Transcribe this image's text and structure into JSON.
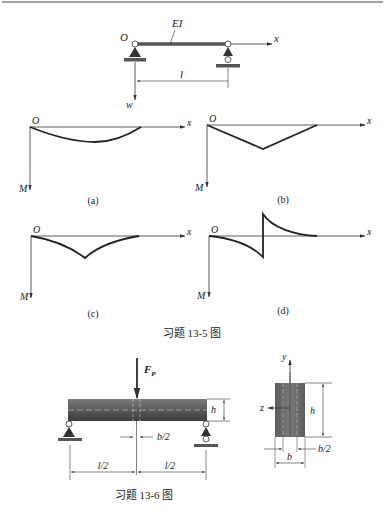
{
  "figure_13_5": {
    "caption": "习题 13-5 图",
    "beam": {
      "label_EI": "EI",
      "label_O": "O",
      "label_x": "x",
      "label_w": "w",
      "label_l": "l"
    },
    "subplots": [
      {
        "id": "a",
        "tag": "(a)",
        "label_O": "O",
        "label_x": "x",
        "label_M": "M",
        "shape": "smooth sag curve"
      },
      {
        "id": "b",
        "tag": "(b)",
        "label_O": "O",
        "label_x": "x",
        "label_M": "M",
        "shape": "triangular (linear) with peak"
      },
      {
        "id": "c",
        "tag": "(c)",
        "label_O": "O",
        "label_x": "x",
        "label_M": "M",
        "shape": "concave cusp"
      },
      {
        "id": "d",
        "tag": "(d)",
        "label_O": "O",
        "label_x": "x",
        "label_M": "M",
        "shape": "antisymmetric with jump"
      }
    ]
  },
  "figure_13_6": {
    "caption": "习题 13-6 图",
    "force_label": "F",
    "force_subscript": "P",
    "dim_h": "h",
    "dim_b_half": "b/2",
    "dim_l_half_left": "l/2",
    "dim_l_half_right": "l/2",
    "section": {
      "label_y": "y",
      "label_z": "z",
      "label_h": "h",
      "label_b": "b",
      "label_b_half": "b/2"
    }
  },
  "colors": {
    "beam_fill_top": "#6a6a6a",
    "beam_fill_bottom": "#3e3e3e",
    "line": "#333333"
  }
}
